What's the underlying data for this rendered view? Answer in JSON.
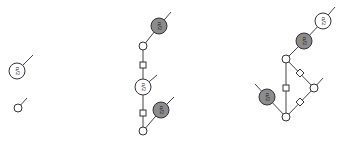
{
  "diagram": {
    "type": "zx-calculus",
    "colors": {
      "white_spider": "#ffffff",
      "gray_spider": "#8c8c8c",
      "stroke": "#333333",
      "wire": "#444444"
    },
    "phase_label": "π/2",
    "panels": [
      {
        "name": "left",
        "nodes": [
          {
            "id": "L1",
            "kind": "white",
            "phase": "π/2",
            "x": 17,
            "y": 71,
            "r": 8
          },
          {
            "id": "L2",
            "kind": "white",
            "phase": "",
            "x": 18,
            "y": 108,
            "r": 4
          }
        ],
        "edges": [
          {
            "from": [
              17,
              71
            ],
            "to": [
              33,
              55
            ],
            "hadamard": false
          },
          {
            "from": [
              18,
              108
            ],
            "to": [
              27,
              98
            ],
            "hadamard": false
          }
        ]
      },
      {
        "name": "middle",
        "nodes": [
          {
            "id": "M1",
            "kind": "gray",
            "phase": "π/2",
            "x": 159,
            "y": 26,
            "r": 8
          },
          {
            "id": "M2",
            "kind": "white",
            "phase": "",
            "x": 143,
            "y": 46,
            "r": 4
          },
          {
            "id": "M3",
            "kind": "white",
            "phase": "π/2",
            "x": 143,
            "y": 87,
            "r": 8
          },
          {
            "id": "M4",
            "kind": "gray",
            "phase": "π/2",
            "x": 161,
            "y": 110,
            "r": 8
          },
          {
            "id": "M5",
            "kind": "white",
            "phase": "",
            "x": 143,
            "y": 131,
            "r": 4
          }
        ],
        "edges": [
          {
            "from": [
              159,
              26
            ],
            "to": [
              171,
              12
            ],
            "hadamard": false
          },
          {
            "from": [
              159,
              26
            ],
            "to": [
              143,
              46
            ],
            "hadamard": false
          },
          {
            "from": [
              143,
              46
            ],
            "to": [
              143,
              87
            ],
            "hadamard": true,
            "box": [
              143,
              65
            ]
          },
          {
            "from": [
              143,
              87
            ],
            "to": [
              157,
              75
            ],
            "hadamard": false
          },
          {
            "from": [
              143,
              87
            ],
            "to": [
              143,
              131
            ],
            "hadamard": true,
            "box": [
              143,
              113
            ]
          },
          {
            "from": [
              161,
              110
            ],
            "to": [
              174,
              97
            ],
            "hadamard": false
          },
          {
            "from": [
              161,
              110
            ],
            "to": [
              143,
              131
            ],
            "hadamard": false
          }
        ]
      },
      {
        "name": "right",
        "nodes": [
          {
            "id": "R1",
            "kind": "white",
            "phase": "π/2",
            "x": 323,
            "y": 21,
            "r": 8
          },
          {
            "id": "R2",
            "kind": "gray",
            "phase": "π/2",
            "x": 304,
            "y": 41,
            "r": 8
          },
          {
            "id": "R3",
            "kind": "white",
            "phase": "",
            "x": 286,
            "y": 59,
            "r": 4
          },
          {
            "id": "R4",
            "kind": "white",
            "phase": "",
            "x": 314,
            "y": 88,
            "r": 4
          },
          {
            "id": "R5",
            "kind": "gray",
            "phase": "π/2",
            "x": 267,
            "y": 97,
            "r": 8
          },
          {
            "id": "R6",
            "kind": "white",
            "phase": "",
            "x": 286,
            "y": 117,
            "r": 4
          }
        ],
        "edges": [
          {
            "from": [
              323,
              21
            ],
            "to": [
              335,
              7
            ],
            "hadamard": false
          },
          {
            "from": [
              323,
              21
            ],
            "to": [
              304,
              41
            ],
            "hadamard": false
          },
          {
            "from": [
              304,
              41
            ],
            "to": [
              286,
              59
            ],
            "hadamard": false
          },
          {
            "from": [
              286,
              59
            ],
            "to": [
              286,
              117
            ],
            "hadamard": true,
            "box": [
              286,
              88
            ]
          },
          {
            "from": [
              286,
              59
            ],
            "to": [
              314,
              88
            ],
            "hadamard": true,
            "diamond": [
              300,
              73
            ]
          },
          {
            "from": [
              314,
              88
            ],
            "to": [
              323,
              78
            ],
            "hadamard": false
          },
          {
            "from": [
              314,
              88
            ],
            "to": [
              286,
              117
            ],
            "hadamard": true,
            "diamond": [
              300,
              102
            ]
          },
          {
            "from": [
              267,
              97
            ],
            "to": [
              255,
              84
            ],
            "hadamard": false
          },
          {
            "from": [
              267,
              97
            ],
            "to": [
              286,
              117
            ],
            "hadamard": false
          }
        ]
      }
    ]
  }
}
